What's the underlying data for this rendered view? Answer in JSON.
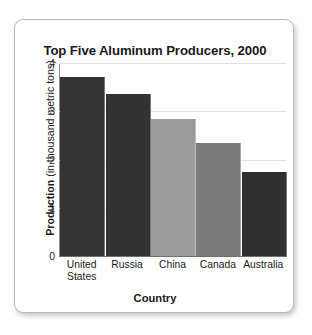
{
  "chart_data": {
    "type": "bar",
    "title": "Top Five Aluminum Producers, 2000",
    "xlabel": "Country",
    "ylabel": "Production (in thousand metric tons)",
    "ylabel_bold_part": "Production",
    "ylabel_regular_part": "(in thousand metric tons)",
    "categories": [
      "United States",
      "Russia",
      "China",
      "Canada",
      "Australia"
    ],
    "category_lines": [
      [
        "United",
        "States"
      ],
      [
        "Russia"
      ],
      [
        "China"
      ],
      [
        "Canada"
      ],
      [
        "Australia"
      ]
    ],
    "values": [
      3.7,
      3.35,
      2.85,
      2.35,
      1.75
    ],
    "bar_colors": [
      "#343434",
      "#333333",
      "#9b9b9b",
      "#7a7a7a",
      "#303030"
    ],
    "ylim": [
      0,
      4
    ],
    "yticks": [
      0,
      1,
      2,
      3,
      4
    ],
    "ytick_labels": [
      "0",
      "1",
      "2",
      "3",
      "4"
    ],
    "grid": true,
    "grid_axis": "y",
    "legend": false,
    "legend_position": "none"
  },
  "frame": {
    "border_color": "#b9b9b9",
    "background": "#ffffff"
  }
}
